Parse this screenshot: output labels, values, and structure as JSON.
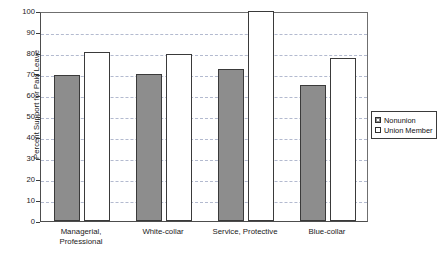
{
  "chart_data": {
    "type": "bar",
    "title": "",
    "subtitle": "",
    "xlabel": "",
    "ylabel": "Percent Support for Paid Leave",
    "categories": [
      "Managerial,\nProfessional",
      "White-collar",
      "Service, Protective",
      "Blue-collar"
    ],
    "series": [
      {
        "name": "Nonunion",
        "color": "#8d8d8d",
        "values": [
          69.5,
          70.0,
          72.3,
          64.8
        ]
      },
      {
        "name": "Union Member",
        "color": "#ffffff",
        "values": [
          80.3,
          79.5,
          100.0,
          77.7
        ]
      }
    ],
    "ylim": [
      0,
      100
    ],
    "yticks": [
      0,
      10,
      20,
      30,
      40,
      50,
      60,
      70,
      80,
      90,
      100
    ],
    "ytick_labels": [
      "0",
      "10",
      "20",
      "30",
      "40",
      "50",
      "60",
      "70",
      "80",
      "90",
      "100"
    ],
    "grid": true,
    "grid_axis": "y",
    "grid_style": "dashed",
    "legend_position": "right",
    "legend": [
      "Nonunion",
      "Union Member"
    ]
  }
}
